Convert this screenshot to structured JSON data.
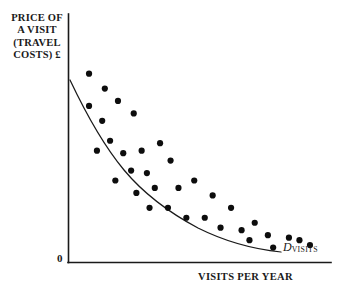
{
  "figure": {
    "background_color": "#ffffff",
    "ink_color": "#1a1a1a"
  },
  "labels": {
    "ylabel": "PRICE OF\nA VISIT\n(TRAVEL\nCOSTS) £",
    "xlabel": "VISITS PER YEAR",
    "origin": "0",
    "curve_symbol": "D",
    "curve_subscript": "VISITS"
  },
  "chart_data": {
    "type": "scatter",
    "title": "",
    "subtitle": "",
    "xlabel": "VISITS PER YEAR",
    "ylabel": "PRICE OF A VISIT (TRAVEL COSTS) £",
    "grid": false,
    "legend": null,
    "axis_tick_labels": {
      "x": [],
      "y": [
        "0"
      ]
    },
    "xlim": [
      0,
      100
    ],
    "ylim": [
      0,
      100
    ],
    "annotations": [
      {
        "text": "D VISITS",
        "symbol": "D",
        "subscript": "VISITS",
        "x": 82,
        "y": 11,
        "description": "label for the fitted demand curve"
      }
    ],
    "series": [
      {
        "name": "Observed visits",
        "type": "scatter",
        "marker": "filled-circle",
        "color": "#0d0d0d",
        "points": [
          [
            8,
            76
          ],
          [
            14,
            70
          ],
          [
            8,
            63
          ],
          [
            19,
            65
          ],
          [
            13,
            57
          ],
          [
            25,
            60
          ],
          [
            16,
            49
          ],
          [
            21,
            44
          ],
          [
            11,
            45
          ],
          [
            28,
            45
          ],
          [
            35,
            48
          ],
          [
            24,
            37
          ],
          [
            30,
            36
          ],
          [
            39,
            41
          ],
          [
            18,
            33
          ],
          [
            26,
            28
          ],
          [
            33,
            30
          ],
          [
            42,
            30
          ],
          [
            48,
            33
          ],
          [
            31,
            22
          ],
          [
            38,
            22
          ],
          [
            55,
            27
          ],
          [
            45,
            18
          ],
          [
            52,
            18
          ],
          [
            62,
            22
          ],
          [
            58,
            14
          ],
          [
            66,
            13
          ],
          [
            71,
            16
          ],
          [
            69,
            9
          ],
          [
            76,
            11
          ],
          [
            78,
            6
          ],
          [
            84,
            10
          ],
          [
            88,
            9
          ],
          [
            92,
            7
          ]
        ]
      }
    ],
    "fit_curve": {
      "name": "D VISITS",
      "type": "line",
      "shape": "convex-decreasing",
      "color": "#1a1a1a",
      "description": "Downward sloping convex demand curve fitted through the scatter of observations",
      "points": [
        [
          3,
          86
        ],
        [
          8,
          74
        ],
        [
          13,
          64
        ],
        [
          19,
          55
        ],
        [
          25,
          47
        ],
        [
          32,
          40
        ],
        [
          40,
          33
        ],
        [
          48,
          27
        ],
        [
          57,
          22
        ],
        [
          66,
          17
        ],
        [
          75,
          13
        ],
        [
          84,
          10
        ],
        [
          92,
          8
        ]
      ]
    }
  }
}
